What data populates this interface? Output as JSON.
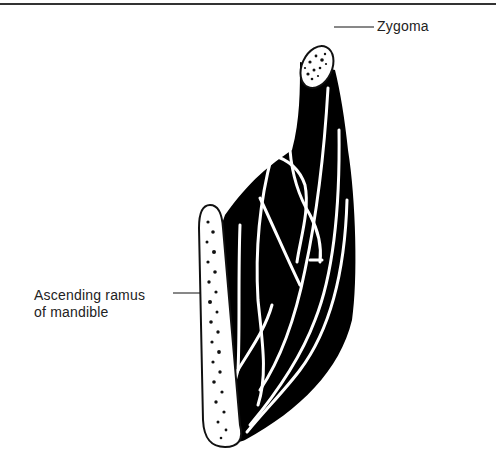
{
  "figure": {
    "labels": {
      "zygoma": "Zygoma",
      "ramus_line1": "Ascending ramus",
      "ramus_line2": "of mandible"
    },
    "colors": {
      "muscle": "#000000",
      "bone_fill": "#ffffff",
      "ink": "#111111"
    }
  }
}
